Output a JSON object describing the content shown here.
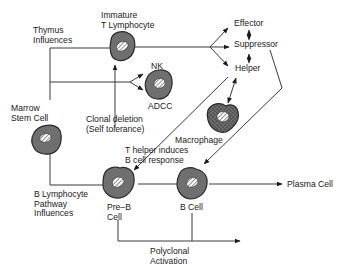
{
  "colors": {
    "cell_fill": "#6f6f6f",
    "cell_stroke": "#2a2a2a",
    "line": "#3a3a3a",
    "text": "#1a1a1a",
    "background": "#ffffff"
  },
  "labels": {
    "thymus_influences": [
      "Thymus",
      "Influences"
    ],
    "immature_t": [
      "Immature",
      "T Lymphocyte"
    ],
    "effector": "Effector",
    "suppressor": "Suppressor",
    "helper": "Helper",
    "nk": "NK",
    "adcc": "ADCC",
    "marrow_stem_cell": [
      "Marrow",
      "Stem Cell"
    ],
    "clonal_deletion": [
      "Clonal deletion",
      "(Self tolerance)"
    ],
    "macrophage": "Macrophage",
    "t_helper_induces": [
      "T helper induces",
      "B cell response"
    ],
    "b_lymphocyte_pathway": [
      "B Lymphocyte",
      "Pathway",
      "Influences"
    ],
    "pre_b_cell": [
      "Pre–B",
      "Cell"
    ],
    "b_cell": "B Cell",
    "plasma_cell": "Plasma Cell",
    "polyclonal_activation": [
      "Polyclonal",
      "Activation"
    ]
  },
  "nodes": [
    {
      "id": "marrow-stem-cell",
      "icon": "cell-icon"
    },
    {
      "id": "immature-t-lymphocyte",
      "icon": "cell-icon"
    },
    {
      "id": "nk-cell",
      "icon": "cell-icon"
    },
    {
      "id": "macrophage",
      "icon": "macrophage-icon"
    },
    {
      "id": "pre-b-cell",
      "icon": "cell-icon"
    },
    {
      "id": "b-cell",
      "icon": "cell-icon"
    }
  ]
}
